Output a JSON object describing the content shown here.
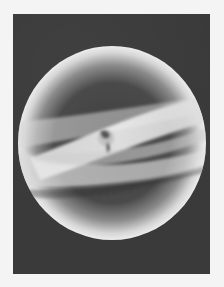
{
  "image": {
    "description": "Grayscale artwork of a luminous translucent sphere with crossing bands and a small Earth-like globe at the center",
    "colors": {
      "page_background": "#f4f4f4",
      "frame_background": "#3a3a3a",
      "sphere_rim": "#e6e6e6",
      "sphere_core": "#4a4a4a",
      "band_light": "#e2e2e2"
    },
    "elements": {
      "sphere": {
        "cx": 112,
        "cy": 143,
        "rx": 94,
        "ry": 97
      },
      "globe": {
        "cx": 106,
        "cy": 138,
        "r": 9
      }
    }
  }
}
